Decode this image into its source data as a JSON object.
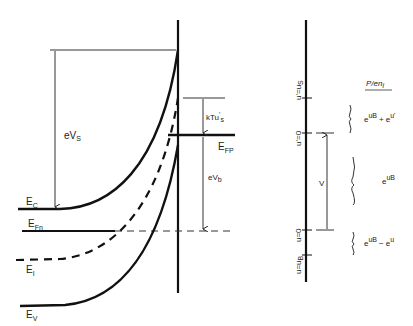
{
  "diagram": {
    "type": "semiconductor-band-diagram",
    "band_labels": {
      "conduction": "E",
      "conduction_sub": "C",
      "electron_quasi_fermi": "E",
      "electron_quasi_fermi_sub": "Fn",
      "intrinsic": "E",
      "intrinsic_sub": "I",
      "valence": "E",
      "valence_sub": "V",
      "hole_quasi_fermi": "E",
      "hole_quasi_fermi_sub": "FP"
    },
    "dimension_labels": {
      "surface_potential": "eV",
      "surface_potential_sub": "S",
      "band_bending": "eV",
      "band_bending_sub": "b",
      "kT_term": "kTu",
      "kT_term_sup": "'",
      "kT_term_sub": "s"
    },
    "right_axis": {
      "ticks": [
        {
          "label": "u'=u",
          "sub": "S",
          "y": 98
        },
        {
          "label": "u'=0",
          "sub": "",
          "y": 133
        },
        {
          "label": "u=0",
          "sub": "",
          "y": 230
        },
        {
          "label": "u=u",
          "sub": "B",
          "y": 255
        }
      ],
      "arrow_label": "V",
      "column_header": "P/en",
      "column_header_sub": "i",
      "region_expressions": [
        {
          "base1": "e",
          "exp1": "u",
          "exp1_sub": "B",
          "op": "+",
          "base2": "e",
          "exp2": "u'"
        },
        {
          "base1": "e",
          "exp1": "u",
          "exp1_sub": "B",
          "op": "",
          "base2": "",
          "exp2": ""
        },
        {
          "base1": "e",
          "exp1": "u",
          "exp1_sub": "B",
          "op": "−",
          "base2": "e",
          "exp2": "u"
        }
      ]
    }
  }
}
